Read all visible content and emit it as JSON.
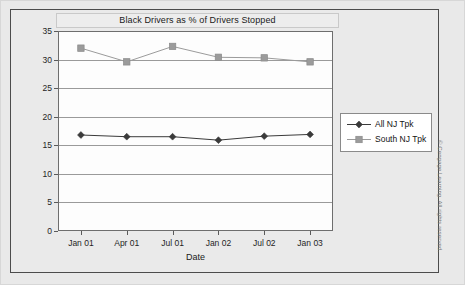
{
  "figure": {
    "title": "Black Drivers as % of Drivers Stopped",
    "credit": "© Cengage Learning. All rights reserved."
  },
  "chart_data": {
    "type": "line",
    "title": "Black Drivers as % of Drivers Stopped",
    "xlabel": "Date",
    "ylabel": "Percentage",
    "categories": [
      "Jan 01",
      "Apr 01",
      "Jul 01",
      "Jan 02",
      "Jul 02",
      "Jan 03"
    ],
    "ylim": [
      0,
      35
    ],
    "yticks": [
      0,
      5,
      10,
      15,
      20,
      25,
      30,
      35
    ],
    "grid": true,
    "legend_position": "right",
    "series": [
      {
        "name": "All NJ Tpk",
        "marker": "diamond",
        "color": "#3a3a3a",
        "values": [
          16.8,
          16.5,
          16.5,
          15.9,
          16.6,
          16.9
        ]
      },
      {
        "name": "South NJ Tpk",
        "marker": "square",
        "color": "#9b9b9b",
        "values": [
          32.0,
          29.6,
          32.3,
          30.4,
          30.3,
          29.6
        ]
      }
    ]
  },
  "colors": {
    "frame": "#4c4c4c",
    "plot_bg": "#fdfdfd",
    "grid": "#9a9a9a",
    "page_bg": "#e9e9e9",
    "series_1": "#3a3a3a",
    "series_2": "#9b9b9b"
  }
}
